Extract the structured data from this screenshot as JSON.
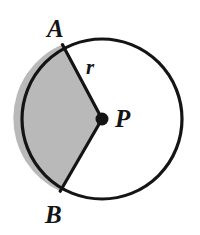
{
  "figure": {
    "kind": "circle-sector-diagram",
    "background_color": "#ffffff",
    "stroke_color": "#141414",
    "shaded_fill_color": "#b9b9b9",
    "stroke_width": 3.2,
    "circle": {
      "center_x": 102,
      "center_y": 119,
      "radius": 80
    },
    "center_point": {
      "label": "P",
      "dot_radius": 6.5,
      "dot_color": "#141414",
      "label_x": 115,
      "label_y": 106
    },
    "points": [
      {
        "label": "A",
        "x": 62,
        "y": 45,
        "angle_deg": 118,
        "label_x": 47,
        "label_y": 16
      },
      {
        "label": "B",
        "x": 62,
        "y": 192,
        "angle_deg": 241,
        "label_x": 45,
        "label_y": 202
      }
    ],
    "radius_label": {
      "label": "r",
      "label_x": 86,
      "label_y": 57
    },
    "shaded_sector": {
      "from_label": "A",
      "to_label": "B",
      "direction": "counterclockwise-through-left",
      "description": "shaded sector APB bounded by radii PA and PB and the minor arc on the left side"
    }
  },
  "labels": {
    "a": "A",
    "b": "B",
    "p": "P",
    "r": "r"
  }
}
